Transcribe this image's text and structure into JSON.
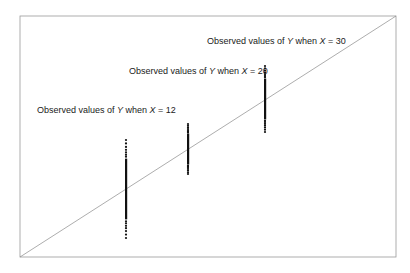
{
  "chart_data": {
    "type": "scatter",
    "title": "",
    "xlabel": "",
    "ylabel": "",
    "grid": false,
    "legend": null,
    "regression_line": {
      "from": {
        "px": 20,
        "py": 257
      },
      "to": {
        "px": 396,
        "py": 16
      },
      "color": "#8a8a8a"
    },
    "frame": {
      "left": 20,
      "top": 16,
      "right": 396,
      "bottom": 257,
      "color": "#9a9a9a"
    },
    "series": [
      {
        "name": "Observed values of Y when X=12",
        "x": 12,
        "px": 126,
        "center_py": 189,
        "min_py": 140,
        "max_py": 238,
        "label": {
          "prefix": "Observed values of ",
          "var_y": "Y",
          "mid": " when ",
          "var_x": "X",
          "eq": " = 12",
          "px": 37,
          "py": 113
        }
      },
      {
        "name": "Observed values of Y when X=20",
        "x": 20,
        "px": 188,
        "center_py": 149,
        "min_py": 124,
        "max_py": 174,
        "label": {
          "prefix": "Observed values of ",
          "var_y": "Y",
          "mid": " when ",
          "var_x": "X",
          "eq": " = 20",
          "px": 129,
          "py": 74
        }
      },
      {
        "name": "Observed values of Y when X=30",
        "x": 30,
        "px": 265,
        "center_py": 99,
        "min_py": 66,
        "max_py": 132,
        "label": {
          "prefix": "Observed values of ",
          "var_y": "Y",
          "mid": " when ",
          "var_x": "X",
          "eq": " = 30",
          "px": 207,
          "py": 44
        }
      }
    ],
    "annotations": [
      "Observed values of Y when X = 12",
      "Observed values of Y when X = 20",
      "Observed values of Y when X = 30"
    ]
  }
}
